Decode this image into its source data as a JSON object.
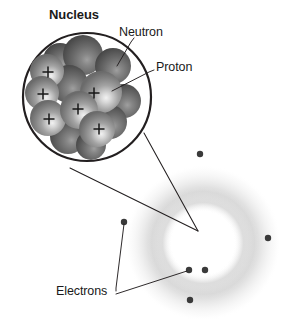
{
  "figure": {
    "background_color": "#ffffff",
    "width": 292,
    "height": 327
  },
  "labels": {
    "nucleus": "Nucleus",
    "neutron": "Neutron",
    "proton": "Proton",
    "electrons": "Electrons"
  },
  "colors": {
    "line": "#231f20",
    "text": "#1a1a1a",
    "proton_sphere": "#8d8d8d",
    "neutron_sphere": "#585858",
    "electron_dot": "#3a3a3a",
    "electron_cloud": "#cfcfcf",
    "nucleus_outline": "#231f20"
  },
  "nucleus_circle": {
    "center_x": 87,
    "center_y": 97,
    "radius": 64,
    "stroke_width": 2.2
  },
  "particles": [
    {
      "type": "neutron",
      "cx": 60,
      "cy": 60,
      "r": 17,
      "charge": ""
    },
    {
      "type": "proton",
      "cx": 47,
      "cy": 71,
      "r": 17,
      "charge": "+"
    },
    {
      "type": "neutron",
      "cx": 83,
      "cy": 55,
      "r": 20,
      "charge": ""
    },
    {
      "type": "neutron",
      "cx": 113,
      "cy": 66,
      "r": 18,
      "charge": ""
    },
    {
      "type": "proton",
      "cx": 42,
      "cy": 93,
      "r": 17,
      "charge": "+"
    },
    {
      "type": "neutron",
      "cx": 69,
      "cy": 84,
      "r": 19,
      "charge": ""
    },
    {
      "type": "proton",
      "cx": 101,
      "cy": 92,
      "r": 21,
      "charge": "+"
    },
    {
      "type": "neutron",
      "cx": 124,
      "cy": 101,
      "r": 17,
      "charge": ""
    },
    {
      "type": "proton",
      "cx": 48,
      "cy": 118,
      "r": 18,
      "charge": "+"
    },
    {
      "type": "proton",
      "cx": 79,
      "cy": 110,
      "r": 19,
      "charge": "+"
    },
    {
      "type": "neutron",
      "cx": 110,
      "cy": 122,
      "r": 17,
      "charge": ""
    },
    {
      "type": "proton",
      "cx": 97,
      "cy": 129,
      "r": 18,
      "charge": "+"
    },
    {
      "type": "neutron",
      "cx": 68,
      "cy": 136,
      "r": 18,
      "charge": ""
    },
    {
      "type": "neutron",
      "cx": 91,
      "cy": 145,
      "r": 15,
      "charge": ""
    }
  ],
  "charge_marks": [
    {
      "x": 48,
      "y": 72
    },
    {
      "x": 43,
      "y": 94
    },
    {
      "x": 94,
      "y": 93
    },
    {
      "x": 49,
      "y": 119
    },
    {
      "x": 78,
      "y": 109
    },
    {
      "x": 99,
      "y": 129
    }
  ],
  "electron_cloud": {
    "center_x": 203,
    "center_y": 243,
    "outer_radius": 78,
    "inner_radius": 38,
    "opacity": 0.55
  },
  "electrons": [
    {
      "cx": 200,
      "cy": 154,
      "r": 3.2
    },
    {
      "cx": 268,
      "cy": 238,
      "r": 3.2
    },
    {
      "cx": 124,
      "cy": 222,
      "r": 3.2
    },
    {
      "cx": 189,
      "cy": 270,
      "r": 3.2
    },
    {
      "cx": 205,
      "cy": 270,
      "r": 3.2
    },
    {
      "cx": 190,
      "cy": 300,
      "r": 3.2
    }
  ],
  "leader_lines": {
    "neutron": [
      [
        133,
        40
      ],
      [
        150,
        67
      ]
    ],
    "proton": [
      [
        153,
        69
      ],
      [
        112,
        90
      ]
    ],
    "magnifier_upper": [
      [
        144,
        133
      ],
      [
        198,
        231
      ]
    ],
    "magnifier_lower": [
      [
        70,
        168
      ],
      [
        198,
        231
      ]
    ],
    "electrons_to_left": [
      [
        116,
        291
      ],
      [
        124,
        224
      ]
    ],
    "electrons_to_cluster": [
      [
        119,
        294
      ],
      [
        187,
        271
      ]
    ]
  },
  "label_positions": {
    "nucleus": {
      "x": 49,
      "y": 10
    },
    "neutron": {
      "x": 119,
      "y": 29
    },
    "proton": {
      "x": 155,
      "y": 64
    },
    "electrons": {
      "x": 56,
      "y": 285
    }
  }
}
